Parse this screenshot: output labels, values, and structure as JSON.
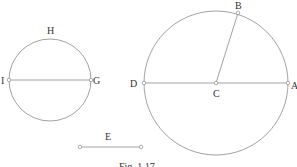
{
  "figure": {
    "caption": "Fig. 1.17",
    "stroke_color": "#8a8a8a",
    "point_fill": "#ffffff"
  },
  "left_circle": {
    "labels": {
      "top": "H",
      "left": "I",
      "right": "G"
    }
  },
  "right_circle": {
    "labels": {
      "top": "B",
      "left": "D",
      "center": "C",
      "right": "A"
    }
  },
  "segment": {
    "label": "E"
  }
}
